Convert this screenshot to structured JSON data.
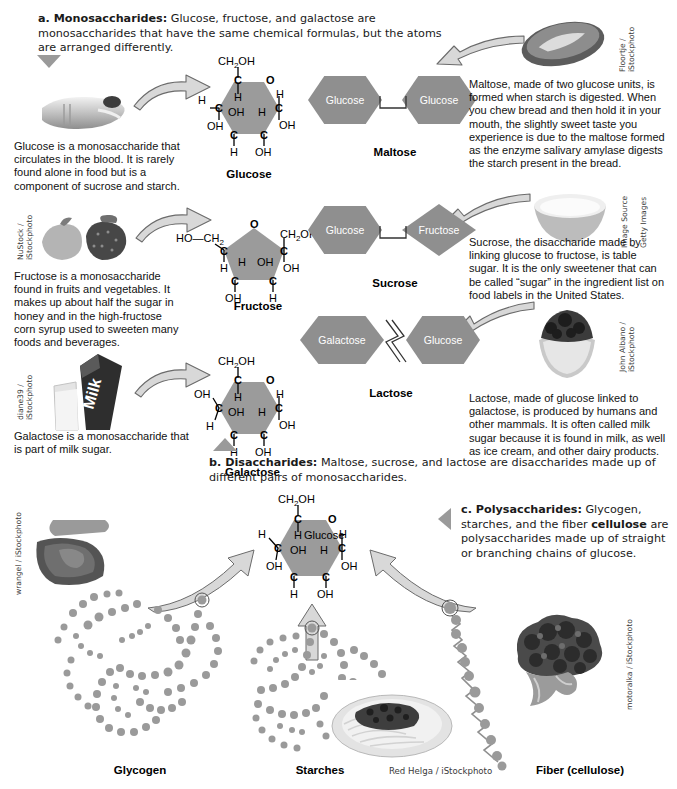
{
  "sections": {
    "a": {
      "marker": "a. Monosaccharides:",
      "text": " Glucose, fructose, and galactose are monosaccharides that have the same chemical formulas, but the atoms are arranged differently."
    },
    "b": {
      "marker": "b. Disaccharides:",
      "text": " Maltose, sucrose, and lactose are disaccharides made up of different pairs of monosaccharides."
    },
    "c": {
      "marker": "c. Polysaccharides:",
      "text_1": " Glycogen, starches, and the fiber ",
      "bold_2": "cellulose",
      "text_3": " are polysaccharides made up of straight or branching chains of glucose."
    }
  },
  "monosaccharides": [
    {
      "name": "Glucose",
      "description": "Glucose is a monosaccharide that circulates in the blood. It is rarely found alone in food but is a component of sucrose and starch.",
      "credit": ""
    },
    {
      "name": "Fructose",
      "description": "Fructose is a monosaccharide found in fruits and vegetables. It makes up about half the sugar in honey and in the high-fructose corn syrup used to sweeten many foods and beverages.",
      "credit": "NuStock /\niStockphoto"
    },
    {
      "name": "Galactose",
      "description": "Galactose is a monosaccharide that is part of milk sugar.",
      "credit": "diane39 /\niStockphoto"
    }
  ],
  "disaccharides": [
    {
      "name": "Maltose",
      "left_unit": "Glucose",
      "right_unit": "Glucose",
      "right_shape": "hexagon",
      "bond": "square",
      "description": "Maltose, made of two glucose units, is formed when starch is digested. When you chew bread and then hold it in your mouth, the slightly sweet taste you experience is due to the maltose formed as the enzyme salivary amylase digests the starch present in the bread.",
      "credit": "Floortje /\niStockphoto"
    },
    {
      "name": "Sucrose",
      "left_unit": "Glucose",
      "right_unit": "Fructose",
      "right_shape": "diamond",
      "bond": "square",
      "description": "Sucrose, the disaccharide made by linking glucose to fructose, is table sugar. It is the only sweetener that can be called “sugar” in the ingredient list on food labels in the United States.",
      "credit": "Image Source /\nGetty Images"
    },
    {
      "name": "Lactose",
      "left_unit": "Galactose",
      "right_unit": "Glucose",
      "right_shape": "hexagon",
      "bond": "zigzag",
      "description": "Lactose, made of glucose linked to galactose, is produced by humans and other mammals. It is often called milk sugar because it is found in milk, as well as ice cream, and other dairy products.",
      "credit": "John Albano /\niStockphoto"
    }
  ],
  "polysaccharides": [
    {
      "name": "Glycogen",
      "credit": "wrangel / iStockphoto"
    },
    {
      "name": "Starches",
      "credit": "Red Helga / iStockphoto"
    },
    {
      "name": "Fiber (cellulose)",
      "credit": "motoralka / iStockphoto"
    }
  ],
  "glucose_ring_center_label": "Glucose",
  "ring_atoms": {
    "glucose": {
      "top": "CH₂OH",
      "top_c": "C",
      "ring_o": "O",
      "left_h": "H",
      "left_c": "C",
      "left_oh": "OH",
      "inner_h_top": "H",
      "inner_oh": "OH",
      "inner_h_mid": "H",
      "right_h": "H",
      "right_c": "C",
      "right_oh": "OH",
      "bottom_left_c": "C",
      "bottom_left_h": "H",
      "bottom_right_c": "C",
      "bottom_right_oh": "OH"
    },
    "fructose": {
      "ho_ch2": "HO—CH₂",
      "ring_o": "O",
      "ch2oh": "CH₂OH",
      "left_c": "C",
      "left_h": "H",
      "inner_h": "H",
      "inner_oh": "OH",
      "right_c": "C",
      "right_oh": "OH",
      "bottom_left_c": "C",
      "bottom_left_oh": "OH",
      "bottom_right_c": "C",
      "bottom_right_h": "H"
    },
    "galactose": {
      "top": "CH₂OH",
      "top_c": "C",
      "ring_o": "O",
      "left_oh": "OH",
      "left_c": "C",
      "left_h": "H",
      "inner_h_top": "H",
      "inner_oh": "OH",
      "inner_h_mid": "H",
      "right_h": "H",
      "right_c": "C",
      "right_oh": "OH",
      "bottom_left_c": "C",
      "bottom_left_h": "H",
      "bottom_right_c": "C",
      "bottom_right_oh": "OH"
    }
  },
  "colors": {
    "hex_fill": "#8f8f8f",
    "ring_fill": "#9b9b9b",
    "arrow_fill": "#d8d8d8",
    "arrow_stroke": "#6b6b6b",
    "triangle": "#9a9a9a",
    "bead": "#9a9a9a",
    "text": "#111111"
  }
}
